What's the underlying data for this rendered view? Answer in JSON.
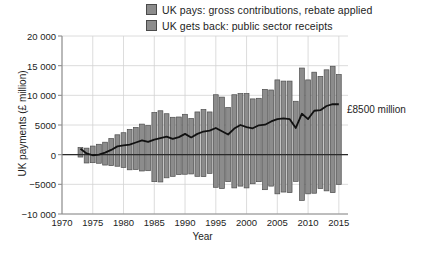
{
  "legend": {
    "items": [
      {
        "label": "UK pays: gross contributions, rebate applied",
        "color": "#8c8c8c",
        "icon": "legend-swatch"
      },
      {
        "label": "UK gets back: public sector receipts",
        "color": "#8c8c8c",
        "icon": "legend-swatch"
      }
    ]
  },
  "annotation_text": "£8500 million",
  "chart_data": {
    "type": "bar",
    "title": "",
    "subtitle": "",
    "xlabel": "Year",
    "ylabel": "UK payments (£ million)",
    "xlim": [
      1970,
      2016
    ],
    "ylim": [
      -10000,
      20000
    ],
    "xticks": [
      1970,
      1975,
      1980,
      1985,
      1990,
      1995,
      2000,
      2005,
      2010,
      2015
    ],
    "yticks": [
      -10000,
      -5000,
      0,
      5000,
      10000,
      15000,
      20000
    ],
    "ytick_labels": [
      "−10 000",
      "−5000",
      "0",
      "5000",
      "10 000",
      "15 000",
      "20 000"
    ],
    "grid": true,
    "legend_position": "top-center",
    "bar_color": "#8c8c8c",
    "bar_edge_color": "#4d4d4d",
    "line_color": "#111111",
    "categories": [
      1973,
      1974,
      1975,
      1976,
      1977,
      1978,
      1979,
      1980,
      1981,
      1982,
      1983,
      1984,
      1985,
      1986,
      1987,
      1988,
      1989,
      1990,
      1991,
      1992,
      1993,
      1994,
      1995,
      1996,
      1997,
      1998,
      1999,
      2000,
      2001,
      2002,
      2003,
      2004,
      2005,
      2006,
      2007,
      2008,
      2009,
      2010,
      2011,
      2012,
      2013,
      2014,
      2015
    ],
    "series": [
      {
        "name": "UK pays: gross contributions, rebate applied",
        "values": [
          1200,
          1100,
          1450,
          1750,
          2100,
          2700,
          3350,
          3700,
          4250,
          4600,
          5150,
          4900,
          7100,
          7400,
          6900,
          6300,
          6350,
          6800,
          6100,
          7200,
          7600,
          7200,
          10100,
          9700,
          7950,
          10100,
          10300,
          10300,
          9400,
          9500,
          11000,
          10900,
          12600,
          12400,
          12400,
          9000,
          14600,
          12600,
          13900,
          13200,
          14300,
          14900,
          13500
        ]
      },
      {
        "name": "UK gets back: public sector receipts",
        "values": [
          -400,
          -1400,
          -1350,
          -1450,
          -1750,
          -1850,
          -1950,
          -2150,
          -2550,
          -2500,
          -2750,
          -2700,
          -4550,
          -4600,
          -3900,
          -3650,
          -3350,
          -3300,
          -3250,
          -3650,
          -3700,
          -3150,
          -5500,
          -5700,
          -4550,
          -5600,
          -5300,
          -5600,
          -4900,
          -4550,
          -5900,
          -5300,
          -6600,
          -6300,
          -6400,
          -4500,
          -7700,
          -6600,
          -6500,
          -5700,
          -6100,
          -6400,
          -5000
        ]
      }
    ],
    "net_line": {
      "name": "Net contribution",
      "color": "#111111",
      "x": [
        1973,
        1974,
        1975,
        1976,
        1977,
        1978,
        1979,
        1980,
        1981,
        1982,
        1983,
        1984,
        1985,
        1986,
        1987,
        1988,
        1989,
        1990,
        1991,
        1992,
        1993,
        1994,
        1995,
        1996,
        1997,
        1998,
        1999,
        2000,
        2001,
        2002,
        2003,
        2004,
        2005,
        2006,
        2007,
        2008,
        2009,
        2010,
        2011,
        2012,
        2013,
        2014,
        2015
      ],
      "values": [
        1000,
        200,
        -100,
        0,
        350,
        800,
        1400,
        1550,
        1700,
        2050,
        2400,
        2150,
        2550,
        2800,
        3050,
        2650,
        2950,
        3500,
        2900,
        3500,
        3900,
        4050,
        4500,
        3950,
        3400,
        4400,
        5000,
        4650,
        4450,
        4950,
        5050,
        5600,
        6000,
        6100,
        6000,
        4500,
        6900,
        6000,
        7400,
        7500,
        8200,
        8500,
        8500
      ]
    },
    "annotations": [
      {
        "text": "£8500 million",
        "x": 2015,
        "y": 8500,
        "position": "right"
      }
    ]
  }
}
